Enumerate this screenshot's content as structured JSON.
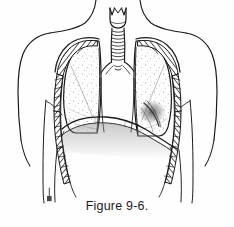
{
  "figure": {
    "caption": "Figure 9-6.",
    "type": "medical-line-illustration",
    "background_color": "#fefefe",
    "ink_color": "#1a1a1a",
    "shading_color": "#808080",
    "stipple_color": "#9a9a9a"
  },
  "anatomy": {
    "parts": [
      {
        "id": "larynx",
        "label": "Larynx / thyroid cartilage",
        "interactable": false
      },
      {
        "id": "trachea",
        "label": "Trachea with cartilage rings",
        "interactable": false
      },
      {
        "id": "carina",
        "label": "Carina / tracheal bifurcation",
        "interactable": false
      },
      {
        "id": "left-main-bronchus",
        "label": "Left main bronchus",
        "interactable": false
      },
      {
        "id": "right-main-bronchus",
        "label": "Right main bronchus",
        "interactable": false
      },
      {
        "id": "right-lung",
        "label": "Right lung (viewer left)",
        "interactable": false
      },
      {
        "id": "left-lung",
        "label": "Left lung (viewer right)",
        "interactable": false
      },
      {
        "id": "rib-cage-left",
        "label": "Rib cage, viewer-left side",
        "interactable": false
      },
      {
        "id": "rib-cage-right",
        "label": "Rib cage, viewer-right side",
        "interactable": false
      },
      {
        "id": "diaphragm",
        "label": "Diaphragm dome",
        "interactable": false
      },
      {
        "id": "mediastinum",
        "label": "Mediastinum",
        "interactable": false
      },
      {
        "id": "neck-outline",
        "label": "Neck contour",
        "interactable": false
      },
      {
        "id": "shoulder-left",
        "label": "Left shoulder and arm contour",
        "interactable": false
      },
      {
        "id": "shoulder-right",
        "label": "Right shoulder and arm contour",
        "interactable": false
      },
      {
        "id": "torso-outline",
        "label": "Torso and flank contour",
        "interactable": false
      },
      {
        "id": "artist-mark",
        "label": "Artist signature mark",
        "interactable": false
      }
    ],
    "rib_count_per_side": 9
  }
}
